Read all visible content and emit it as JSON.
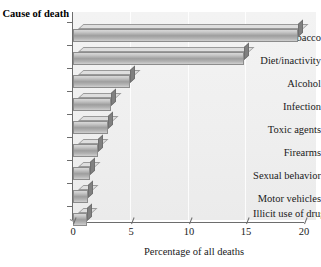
{
  "chart_data": {
    "type": "bar",
    "orientation": "horizontal",
    "title": "",
    "ylabel": "Cause of death",
    "xlabel": "Percentage of all deaths",
    "xlim": [
      0,
      20
    ],
    "xticks": [
      0,
      5,
      10,
      15,
      20
    ],
    "grid": false,
    "legend": false,
    "categories": [
      "Tobacco",
      "Diet/inactivity",
      "Alcohol",
      "Infection",
      "Toxic agents",
      "Firearms",
      "Sexual behavior",
      "Motor vehicles",
      "Illicit use of drugs"
    ],
    "values": [
      19.5,
      14.8,
      4.9,
      3.3,
      3.0,
      2.2,
      1.5,
      1.3,
      1.2
    ],
    "series": [
      {
        "name": "Percentage of all deaths",
        "values": [
          19.5,
          14.8,
          4.9,
          3.3,
          3.0,
          2.2,
          1.5,
          1.3,
          1.2
        ]
      }
    ]
  },
  "axis": {
    "y_title": "Cause of death",
    "x_title": "Percentage of all deaths",
    "x_tick_labels": [
      "0",
      "5",
      "10",
      "15",
      "20"
    ]
  },
  "colors": {
    "bar_face": "#9e9e9e",
    "bar_top": "#dedede",
    "bar_side": "#808080",
    "axis_line": "#6d6d6d",
    "plot_background": "#efefef",
    "page_background": "#ffffff",
    "text": "#1a1a1a"
  }
}
